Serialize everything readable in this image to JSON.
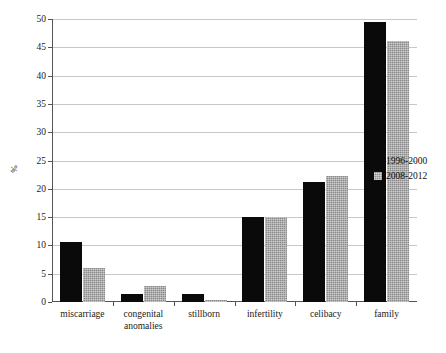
{
  "chart_data": {
    "type": "bar",
    "title": "",
    "xlabel": "",
    "ylabel": "%",
    "ylim": [
      0,
      50
    ],
    "yticks": [
      0,
      5,
      10,
      15,
      20,
      25,
      30,
      35,
      40,
      45,
      50
    ],
    "ytick_labels": [
      "0",
      "5",
      "10",
      "15",
      "20",
      "25",
      "30",
      "35",
      "40",
      "45",
      "50"
    ],
    "grid": "horizontal",
    "legend_position": "right",
    "categories": [
      "miscarriage",
      "congenital anomalies",
      "stillborn",
      "infertility",
      "celibacy",
      "family"
    ],
    "category_lines": [
      [
        "miscarriage"
      ],
      [
        "congenital",
        "anomalies"
      ],
      [
        "stillborn"
      ],
      [
        "infertility"
      ],
      [
        "celibacy"
      ],
      [
        "family"
      ]
    ],
    "series": [
      {
        "name": "1996-2000",
        "color": "#0a0a0a",
        "values": [
          10.6,
          1.4,
          1.4,
          15.0,
          21.2,
          49.5
        ]
      },
      {
        "name": "2008-2012",
        "color": "#8a8a8a",
        "values": [
          6.0,
          2.9,
          0.4,
          15.0,
          22.2,
          46.2
        ]
      }
    ]
  },
  "legend": {
    "items": [
      {
        "label": "1996-2000",
        "swatch": "black-square-icon"
      },
      {
        "label": "2008-2012",
        "swatch": "gray-square-icon"
      }
    ]
  },
  "axes": {
    "y_title": "%"
  }
}
